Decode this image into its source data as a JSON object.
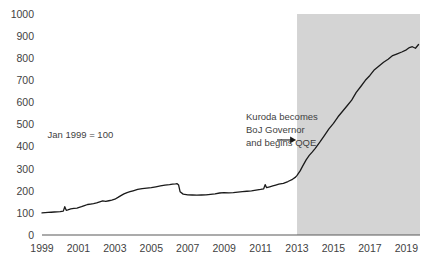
{
  "chart_data": {
    "type": "line",
    "title": "",
    "subtitle": "",
    "xlabel": "",
    "ylabel": "",
    "note": "Jan 1999 = 100",
    "grid": false,
    "legend": "none",
    "xlim": [
      1999,
      2019.75
    ],
    "ylim": [
      0,
      1000
    ],
    "y_ticks": [
      0,
      100,
      200,
      300,
      400,
      500,
      600,
      700,
      800,
      900,
      1000
    ],
    "y_tick_labels": [
      "0",
      "100",
      "200",
      "300",
      "400",
      "500",
      "600",
      "700",
      "800",
      "900",
      "1000"
    ],
    "x_ticks": [
      1999,
      2001,
      2003,
      2005,
      2007,
      2009,
      2011,
      2013,
      2015,
      2017,
      2019
    ],
    "x_tick_labels": [
      "1999",
      "2001",
      "2003",
      "2005",
      "2007",
      "2009",
      "2011",
      "2013",
      "2015",
      "2017",
      "2019"
    ],
    "shaded_regions": [
      {
        "name": "qqe-period",
        "x_start": 2013.0,
        "x_end": 2019.75,
        "color": "#d4d4d4"
      }
    ],
    "annotations": [
      {
        "name": "kuroda-annotation",
        "lines": [
          "Kuroda becomes",
          "BoJ Governor",
          "and begins QQE"
        ],
        "x": 2010.2,
        "y": 520,
        "arrow_from_x": 2011.9,
        "arrow_to_x": 2012.95,
        "arrow_y": 430
      }
    ],
    "series": [
      {
        "name": "BoJ balance sheet index",
        "color": "#1a1a1a",
        "x": [
          1999.0,
          1999.17,
          1999.33,
          1999.5,
          1999.67,
          1999.83,
          2000.0,
          2000.17,
          2000.25,
          2000.33,
          2000.42,
          2000.58,
          2000.75,
          2000.92,
          2001.0,
          2001.17,
          2001.33,
          2001.5,
          2001.67,
          2001.83,
          2002.0,
          2002.17,
          2002.33,
          2002.5,
          2002.67,
          2002.83,
          2003.0,
          2003.17,
          2003.33,
          2003.5,
          2003.67,
          2003.83,
          2004.0,
          2004.25,
          2004.5,
          2004.75,
          2005.0,
          2005.25,
          2005.5,
          2005.75,
          2006.0,
          2006.17,
          2006.33,
          2006.42,
          2006.5,
          2006.58,
          2006.75,
          2006.92,
          2007.0,
          2007.25,
          2007.5,
          2007.75,
          2008.0,
          2008.25,
          2008.5,
          2008.75,
          2009.0,
          2009.25,
          2009.5,
          2009.75,
          2010.0,
          2010.25,
          2010.5,
          2010.75,
          2011.0,
          2011.17,
          2011.25,
          2011.33,
          2011.5,
          2011.67,
          2011.83,
          2012.0,
          2012.25,
          2012.5,
          2012.75,
          2012.92,
          2013.0,
          2013.17,
          2013.33,
          2013.5,
          2013.67,
          2013.83,
          2014.0,
          2014.25,
          2014.5,
          2014.75,
          2015.0,
          2015.25,
          2015.5,
          2015.75,
          2016.0,
          2016.25,
          2016.5,
          2016.75,
          2017.0,
          2017.25,
          2017.5,
          2017.75,
          2018.0,
          2018.25,
          2018.5,
          2018.75,
          2019.0,
          2019.17,
          2019.33,
          2019.5,
          2019.67
        ],
        "y": [
          100,
          101,
          102,
          103,
          104,
          105,
          106,
          108,
          128,
          112,
          114,
          118,
          120,
          122,
          124,
          128,
          133,
          138,
          140,
          142,
          145,
          150,
          154,
          152,
          155,
          158,
          162,
          170,
          178,
          186,
          192,
          196,
          200,
          206,
          210,
          212,
          214,
          218,
          222,
          226,
          228,
          230,
          231,
          232,
          226,
          196,
          185,
          183,
          182,
          181,
          180,
          181,
          182,
          184,
          186,
          190,
          192,
          191,
          192,
          194,
          196,
          198,
          200,
          203,
          206,
          209,
          228,
          214,
          218,
          222,
          226,
          230,
          234,
          242,
          252,
          262,
          270,
          290,
          315,
          340,
          360,
          375,
          392,
          420,
          450,
          480,
          505,
          535,
          560,
          585,
          610,
          645,
          672,
          700,
          722,
          748,
          765,
          782,
          795,
          812,
          820,
          828,
          838,
          848,
          852,
          845,
          862
        ]
      }
    ]
  }
}
